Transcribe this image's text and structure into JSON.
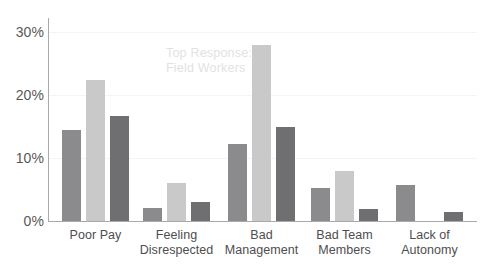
{
  "chart_data": {
    "type": "bar",
    "title": "",
    "subtitle": "",
    "xlabel": "",
    "ylabel": "",
    "ylim": [
      0,
      30
    ],
    "y_ticks": [
      "0%",
      "10%",
      "20%",
      "30%"
    ],
    "y_tick_values": [
      0,
      10,
      20,
      30
    ],
    "grid": true,
    "legend": "none",
    "categories": [
      "Poor Pay",
      "Feeling\nDisrespected",
      "Bad\nManagement",
      "Bad Team\nMembers",
      "Lack of\nAutonomy"
    ],
    "series": [
      {
        "name": "Series 1",
        "color": "#8b8b8d",
        "values": [
          14.5,
          2.0,
          12.2,
          5.3,
          5.8
        ]
      },
      {
        "name": "Series 2",
        "color": "#c9c9c9",
        "values": [
          22.5,
          6.0,
          28.0,
          8.0,
          0
        ]
      },
      {
        "name": "Series 3",
        "color": "#6f6f71",
        "values": [
          16.7,
          3.0,
          15.0,
          1.9,
          1.4
        ]
      }
    ],
    "annotations": [
      {
        "name": "top-response-watermark",
        "text": "Top Response:\nField Workers",
        "color": "#e2e2e2"
      }
    ]
  },
  "axis": {
    "line_color": "#a9a9a9",
    "grid_color": "#f4f4f4",
    "tick_color": "#58585a",
    "label_color": "#4d4d4f"
  }
}
